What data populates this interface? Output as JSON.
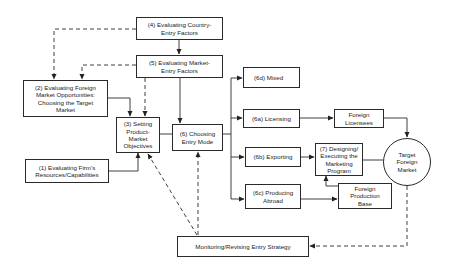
{
  "diagram": {
    "nodes": {
      "country_entry": {
        "label": "(4) Evaluating Country-\nEntry Factors"
      },
      "market_entry": {
        "label": "(5) Evaluating Market-\nEntry Factors"
      },
      "foreign_market": {
        "label": "(2) Evaluating Foreign\nMarket Opportunities:\nChoosing the Target\nMarket"
      },
      "objectives": {
        "label": "(3) Setting\nProduct-\nMarket\nObjectives"
      },
      "entry_mode": {
        "label": "(6) Choosing\nEntry Mode"
      },
      "firm_resources": {
        "label": "(1) Evaluating Firm's\nResources/Capabilities"
      },
      "mixed": {
        "label": "(6d) Mixed"
      },
      "licensing": {
        "label": "(6a) Licensing"
      },
      "exporting": {
        "label": "(6b) Exporting"
      },
      "producing_abroad": {
        "label": "(6c) Producing\nAbroad"
      },
      "foreign_licensees": {
        "label": "Foreign\nLicensees"
      },
      "marketing_program": {
        "label": "(7) Designing/\nExecuting the\nMarketing\nProgram"
      },
      "production_base": {
        "label": "Foreign\nProduction\nBase"
      },
      "target_market": {
        "label": "Target\nForeign\nMarket"
      },
      "monitoring": {
        "label": "Monitoring/Revising Entry Strategy"
      }
    },
    "edges": [
      {
        "from": "country_entry",
        "to": "market_entry",
        "style": "solid"
      },
      {
        "from": "country_entry",
        "to": "foreign_market",
        "style": "dashed"
      },
      {
        "from": "market_entry",
        "to": "foreign_market",
        "style": "dashed"
      },
      {
        "from": "market_entry",
        "to": "objectives",
        "style": "dashed"
      },
      {
        "from": "market_entry",
        "to": "entry_mode",
        "style": "solid"
      },
      {
        "from": "foreign_market",
        "to": "objectives",
        "style": "solid"
      },
      {
        "from": "firm_resources",
        "to": "objectives",
        "style": "solid"
      },
      {
        "from": "objectives",
        "to": "entry_mode",
        "style": "solid"
      },
      {
        "from": "entry_mode",
        "to": "mixed",
        "style": "solid"
      },
      {
        "from": "entry_mode",
        "to": "licensing",
        "style": "solid"
      },
      {
        "from": "entry_mode",
        "to": "exporting",
        "style": "solid"
      },
      {
        "from": "entry_mode",
        "to": "producing_abroad",
        "style": "solid"
      },
      {
        "from": "licensing",
        "to": "foreign_licensees",
        "style": "solid"
      },
      {
        "from": "foreign_licensees",
        "to": "target_market",
        "style": "solid"
      },
      {
        "from": "exporting",
        "to": "marketing_program",
        "style": "solid"
      },
      {
        "from": "producing_abroad",
        "to": "production_base",
        "style": "solid"
      },
      {
        "from": "production_base",
        "to": "marketing_program",
        "style": "solid"
      },
      {
        "from": "marketing_program",
        "to": "target_market",
        "style": "solid"
      },
      {
        "from": "target_market",
        "to": "monitoring",
        "style": "dashed"
      },
      {
        "from": "monitoring",
        "to": "objectives",
        "style": "dashed"
      },
      {
        "from": "monitoring",
        "to": "entry_mode",
        "style": "dashed"
      }
    ]
  }
}
